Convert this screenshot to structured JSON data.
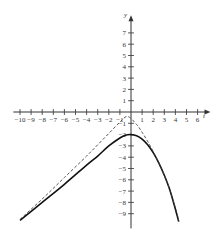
{
  "chart_data": {
    "type": "line",
    "title": "",
    "xlabel": "t",
    "ylabel": "y",
    "xlim": [
      -10.5,
      6.8
    ],
    "ylim": [
      -10.2,
      8.4
    ],
    "grid": false,
    "legend": null,
    "x_ticks": [
      -10,
      -9,
      -8,
      -7,
      -6,
      -5,
      -4,
      -3,
      -2,
      -1,
      1,
      2,
      3,
      4,
      5,
      6
    ],
    "y_ticks": [
      -9,
      -8,
      -7,
      -6,
      -5,
      -4,
      -3,
      -2,
      -1,
      1,
      2,
      3,
      4,
      5,
      6,
      7
    ],
    "series": [
      {
        "name": "solid curve",
        "style": "solid",
        "color": "#111111",
        "x": [
          -10,
          -8,
          -6,
          -4,
          -3,
          -2,
          -1,
          -0.5,
          0,
          0.5,
          1,
          1.5,
          2,
          2.5,
          3,
          3.5,
          4,
          4.3
        ],
        "y": [
          -9.6,
          -8.0,
          -6.4,
          -4.7,
          -3.9,
          -3.0,
          -2.3,
          -2.05,
          -2.0,
          -2.1,
          -2.4,
          -2.9,
          -3.6,
          -4.5,
          -5.6,
          -6.9,
          -8.6,
          -9.7
        ]
      },
      {
        "name": "dashed curve",
        "style": "dashed",
        "color": "#444444",
        "x": [
          -10,
          -8,
          -6,
          -4,
          -3,
          -2,
          -1,
          -0.3,
          0.5,
          1,
          1.5,
          2,
          2.5,
          3,
          3.5,
          4,
          4.3
        ],
        "y": [
          -9.5,
          -7.7,
          -5.8,
          -3.9,
          -2.9,
          -1.9,
          -0.9,
          -0.4,
          -1.1,
          -1.8,
          -2.6,
          -3.5,
          -4.5,
          -5.6,
          -6.9,
          -8.5,
          -9.6
        ]
      }
    ]
  },
  "axes": {
    "x_name": "t",
    "y_name": "y"
  }
}
